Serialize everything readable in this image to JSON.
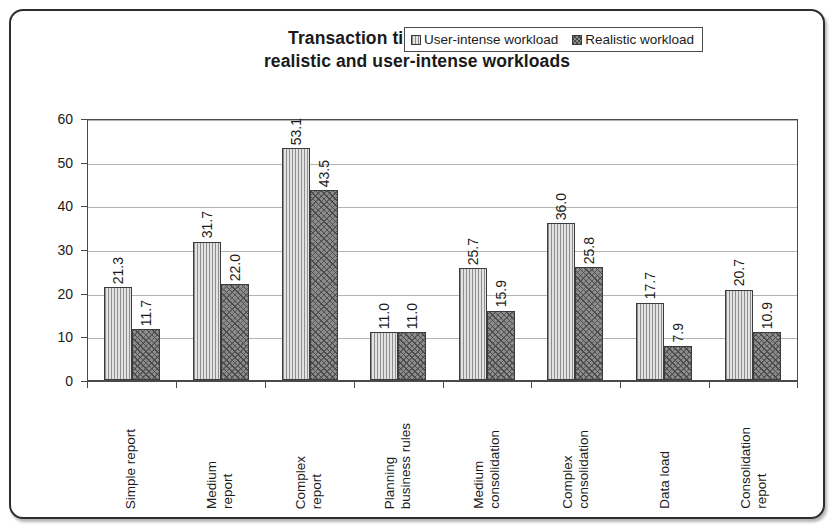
{
  "figure": {
    "title_line1": "Transaction time (seconds) for",
    "title_line2": "realistic and user-intense workloads"
  },
  "legend": {
    "position": "inside-top-right",
    "items": [
      {
        "label": "User-intense workload",
        "swatch": "light-vertical-hatch",
        "color": "#d5d5d5"
      },
      {
        "label": "Realistic workload",
        "swatch": "dark-diagonal-crosshatch",
        "color": "#8c8c8c"
      }
    ]
  },
  "yaxis": {
    "ticks": [
      "0",
      "10",
      "20",
      "30",
      "40",
      "50",
      "60"
    ],
    "min": 0,
    "max": 60,
    "step": 10
  },
  "chart_data": {
    "type": "bar",
    "title": "Transaction time (seconds) for realistic and user-intense workloads",
    "xlabel": "",
    "ylabel": "",
    "ylim": [
      0,
      60
    ],
    "ytick_step": 10,
    "grid": true,
    "legend_position": "inside top right",
    "orientation": "vertical grouped",
    "categories": [
      "Simple report",
      "Medium\nreport",
      "Complex\nreport",
      "Planning\nbusiness rules",
      "Medium\nconsolidation",
      "Complex\nconsolidation",
      "Data load",
      "Consolidation\nreport"
    ],
    "series": [
      {
        "name": "User-intense workload",
        "values": [
          21.3,
          31.7,
          53.1,
          11.0,
          25.7,
          36.0,
          17.7,
          20.7
        ],
        "labels": [
          "21.3",
          "31.7",
          "53.1",
          "11.0",
          "25.7",
          "36.0",
          "17.7",
          "20.7"
        ]
      },
      {
        "name": "Realistic workload",
        "values": [
          11.7,
          22.0,
          43.5,
          11.0,
          15.9,
          25.8,
          7.9,
          10.9
        ],
        "labels": [
          "11.7",
          "22.0",
          "43.5",
          "11.0",
          "15.9",
          "25.8",
          "7.9",
          "10.9"
        ]
      }
    ]
  }
}
